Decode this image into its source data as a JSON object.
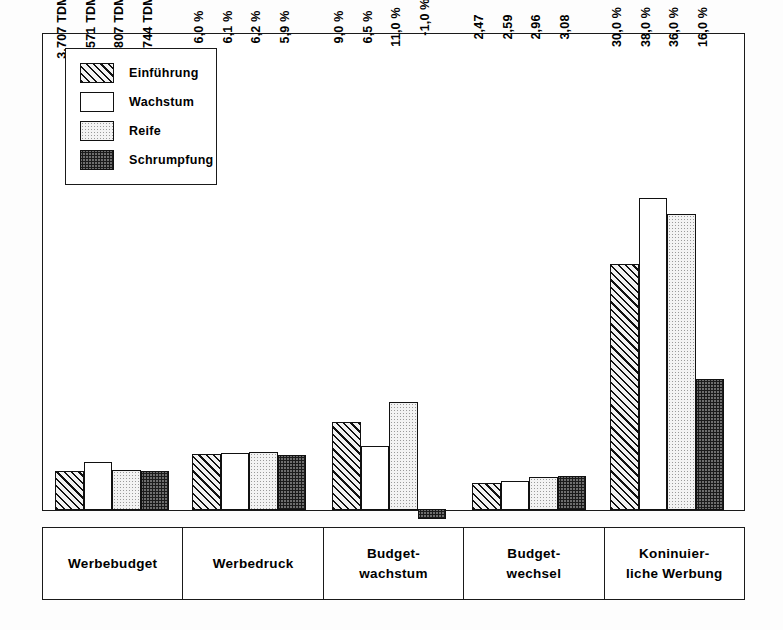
{
  "chart_data": {
    "type": "bar",
    "title": "",
    "subtitle": "",
    "xlabel": "",
    "ylabel": "",
    "grid": false,
    "legend_position": "top-left",
    "categories": [
      "Werbebudget",
      "Werbedruck",
      "Budget-\nwachstum",
      "Budget-\nwechsel",
      "Koninuier-\nliche Werbung"
    ],
    "series": [
      {
        "name": "Einführung",
        "fill": "diagonal-hatch",
        "values": [
          3707,
          6.0,
          9.0,
          2.47,
          30.0
        ],
        "labels": [
          "3.707 TDM",
          "6,0 %",
          "9,0 %",
          "2,47",
          "30,0 %"
        ]
      },
      {
        "name": "Wachstum",
        "fill": "white",
        "values": [
          4571,
          6.1,
          6.5,
          2.59,
          38.0
        ],
        "labels": [
          "4.571 TDM",
          "6,1 %",
          "6,5 %",
          "2,59",
          "38,0 %"
        ]
      },
      {
        "name": "Reife",
        "fill": "light-dots",
        "values": [
          3807,
          6.2,
          11.0,
          2.96,
          36.0
        ],
        "labels": [
          "3.807 TDM",
          "6,2 %",
          "11,0 %",
          "2,96",
          "36,0 %"
        ]
      },
      {
        "name": "Schrumpfung",
        "fill": "dark-dots",
        "values": [
          3744,
          5.9,
          -1.0,
          3.08,
          16.0
        ],
        "labels": [
          "3.744 TDM",
          "5,9 %",
          "-1,0 %",
          "3,08",
          "16,0 %"
        ]
      }
    ]
  },
  "legend": {
    "items": [
      {
        "label": "Einführung",
        "fill": "diagonal-hatch"
      },
      {
        "label": "Wachstum",
        "fill": "white"
      },
      {
        "label": "Reife",
        "fill": "light-dots"
      },
      {
        "label": "Schrumpfung",
        "fill": "dark-dots"
      }
    ]
  },
  "colors": {
    "frame": "#1a1a1a",
    "background": "#ffffff",
    "hatch": "#111111",
    "light_dots": "#f3f3f3",
    "dark_dots": "#6e6e6e"
  }
}
